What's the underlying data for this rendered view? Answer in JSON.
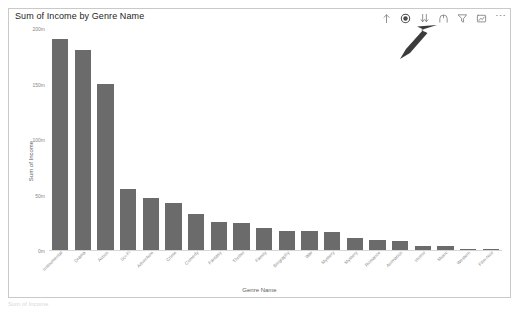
{
  "visual": {
    "title": "Sum of Income by Genre Name",
    "toolbar": {
      "items": [
        {
          "name": "drill-up-icon",
          "label": "Drill Up",
          "active": false
        },
        {
          "name": "drill-down-mode-icon",
          "label": "Click to turn on Drill Down",
          "active": true
        },
        {
          "name": "expand-next-level-icon",
          "label": "Go to the next level in the hierarchy",
          "active": false
        },
        {
          "name": "expand-all-icon",
          "label": "Expand all down one level in the hierarchy",
          "active": false
        },
        {
          "name": "filter-icon",
          "label": "Filters",
          "active": false
        },
        {
          "name": "focus-mode-icon",
          "label": "Focus mode",
          "active": false
        }
      ],
      "more_label": "More options"
    },
    "annotation": {
      "name": "pointer-arrow",
      "target": "drill-down-mode-icon"
    }
  },
  "chart_data": {
    "type": "bar",
    "title": "Sum of Income by Genre Name",
    "xlabel": "Genre Name",
    "ylabel": "Sum of Income",
    "ylim": [
      0,
      200000000
    ],
    "ytick_labels": [
      "200m",
      "150m",
      "100m",
      "50m",
      "0m"
    ],
    "ytick_values": [
      200000000,
      150000000,
      100000000,
      50000000,
      0
    ],
    "grid": false,
    "legend": "none",
    "bar_color": "#6b6b6b",
    "categories": [
      "Instrumental",
      "Drama",
      "Action",
      "Sci-Fi",
      "Adventure",
      "Crime",
      "Comedy",
      "Fantasy",
      "Thriller",
      "Family",
      "Biography",
      "War",
      "Mystery",
      "Mystery",
      "Romance",
      "Animation",
      "Horror",
      "Music",
      "Western",
      "Film-Noir"
    ],
    "values": [
      191000000,
      181000000,
      150000000,
      55000000,
      47000000,
      43000000,
      33000000,
      25000000,
      24000000,
      20000000,
      17000000,
      17000000,
      16000000,
      11000000,
      9000000,
      8000000,
      4000000,
      3500000,
      1200000,
      500000
    ]
  },
  "footnote": "Sum of Income"
}
